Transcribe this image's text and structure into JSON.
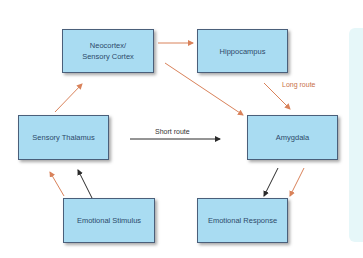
{
  "diagram": {
    "nodes": {
      "neocortex": {
        "line1": "Neocortex/",
        "line2": "Sensory Cortex"
      },
      "hippocampus": {
        "label": "Hippocampus"
      },
      "thalamus": {
        "label": "Sensory Thalamus"
      },
      "amygdala": {
        "label": "Amygdala"
      },
      "stimulus": {
        "label": "Emotional Stimulus"
      },
      "response": {
        "label": "Emotional Response"
      }
    },
    "edge_labels": {
      "long_route": "Long route",
      "short_route": "Short route"
    },
    "colors": {
      "box_fill": "#a9dcf2",
      "box_border": "#4a5f7a",
      "long_route": "#d9825a",
      "short_route": "#2b2b2b",
      "side_panel": "#e6f7f9"
    }
  }
}
